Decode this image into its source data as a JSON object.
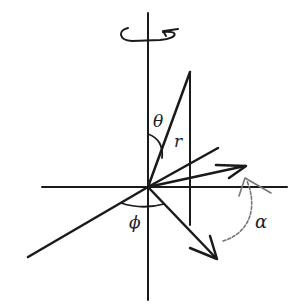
{
  "diagram": {
    "type": "spherical-coordinates-rotation",
    "labels": {
      "theta": "θ",
      "r": "r",
      "phi": "ϕ",
      "alpha": "α"
    },
    "colors": {
      "line": "#1a1a1a",
      "arc_alpha": "#777777",
      "background": "#ffffff"
    },
    "elements": [
      "vertical-axis",
      "horizontal-axis",
      "rotation-arrow",
      "r-vector",
      "dropline",
      "arrow-vector-right",
      "vector-lower-right",
      "line-lower-left",
      "theta-arc",
      "phi-arc",
      "alpha-arc"
    ]
  }
}
